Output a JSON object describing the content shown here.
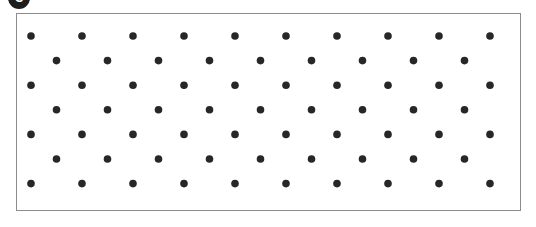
{
  "figure": {
    "panel_label": "C",
    "background_color": "#ffffff"
  },
  "panel": {
    "border_color": "#8c8c8c",
    "border_width_px": 1,
    "fill_color": "#ffffff",
    "x_px": 16,
    "y_px": 13,
    "width_px": 505,
    "height_px": 198
  },
  "lattice": {
    "description": "staggered hexagonal dot lattice",
    "dot_color": "#27272a",
    "dot_radius_px": 3.8,
    "rows": 7,
    "column_spacing_px": 51,
    "row_spacing_px": 24.6,
    "odd_row_count": 10,
    "even_row_count": 9,
    "odd_row_first_x_px": 14,
    "even_row_first_x_px": 39.5,
    "first_row_y_px": 22,
    "points": [
      {
        "row": 1,
        "y": 22,
        "xs": [
          14,
          65,
          116,
          167,
          218,
          269,
          320,
          371,
          422,
          473
        ]
      },
      {
        "row": 2,
        "y": 46.6,
        "xs": [
          39.5,
          90.5,
          141.5,
          192.5,
          243.5,
          294.5,
          345.5,
          396.5,
          447.5
        ]
      },
      {
        "row": 3,
        "y": 71.2,
        "xs": [
          14,
          65,
          116,
          167,
          218,
          269,
          320,
          371,
          422,
          473
        ]
      },
      {
        "row": 4,
        "y": 95.8,
        "xs": [
          39.5,
          90.5,
          141.5,
          192.5,
          243.5,
          294.5,
          345.5,
          396.5,
          447.5
        ]
      },
      {
        "row": 5,
        "y": 120.4,
        "xs": [
          14,
          65,
          116,
          167,
          218,
          269,
          320,
          371,
          422,
          473
        ]
      },
      {
        "row": 6,
        "y": 145.0,
        "xs": [
          39.5,
          90.5,
          141.5,
          192.5,
          243.5,
          294.5,
          345.5,
          396.5,
          447.5
        ]
      },
      {
        "row": 7,
        "y": 169.6,
        "xs": [
          14,
          65,
          116,
          167,
          218,
          269,
          320,
          371,
          422,
          473
        ]
      }
    ]
  }
}
